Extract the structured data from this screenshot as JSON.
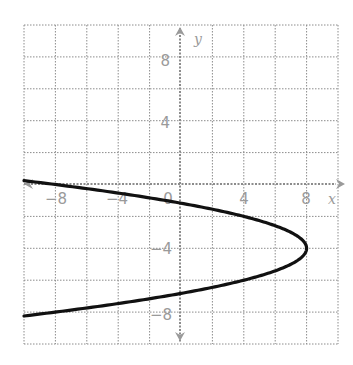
{
  "chart_data": {
    "type": "line",
    "title": "",
    "xlabel": "x",
    "ylabel": "y",
    "xlim": [
      -10,
      10
    ],
    "ylim": [
      -10,
      10
    ],
    "grid": true,
    "grid_step": 2,
    "x_tick_labels": [
      "-8",
      "-4",
      "0",
      "4",
      "8"
    ],
    "y_tick_labels": [
      "8",
      "4",
      "-4",
      "-8"
    ],
    "series": [
      {
        "name": "parabola",
        "equation": "x = -(y + 4)^2 + 8",
        "vertex": [
          8,
          -4
        ],
        "opens": "left",
        "points": [
          {
            "x": -10,
            "y": 0.24
          },
          {
            "x": -8,
            "y": 0
          },
          {
            "x": -1,
            "y": -1
          },
          {
            "x": 0,
            "y": -1.17
          },
          {
            "x": 4,
            "y": -2
          },
          {
            "x": 7,
            "y": -3
          },
          {
            "x": 8,
            "y": -4
          },
          {
            "x": 7,
            "y": -5
          },
          {
            "x": 4,
            "y": -6
          },
          {
            "x": 0,
            "y": -6.83
          },
          {
            "x": -8,
            "y": -8
          },
          {
            "x": -10,
            "y": -8.24
          }
        ]
      }
    ]
  },
  "labels": {
    "x_axis": "x",
    "y_axis": "y",
    "x_ticks": [
      {
        "value": -8,
        "text": "−8"
      },
      {
        "value": -4,
        "text": "−4"
      },
      {
        "value": 0,
        "text": "0"
      },
      {
        "value": 4,
        "text": "4"
      },
      {
        "value": 8,
        "text": "8"
      }
    ],
    "y_ticks": [
      {
        "value": 8,
        "text": "8"
      },
      {
        "value": 4,
        "text": "4"
      },
      {
        "value": -4,
        "text": "−4"
      },
      {
        "value": -8,
        "text": "−8"
      }
    ]
  },
  "colors": {
    "grid": "#8c8c8c",
    "axis": "#8c8c8c",
    "curve": "#111111",
    "text": "#9a9a9a"
  }
}
